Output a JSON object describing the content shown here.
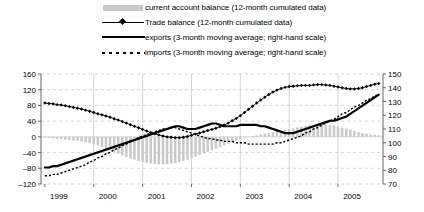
{
  "legend": {
    "items": [
      {
        "label": "current account balance (12-month cumulated data)",
        "marker": "bars-swatch-icon"
      },
      {
        "label": "Trade balance (12-month cumulated data)",
        "marker": "thin-line-diamond-icon"
      },
      {
        "label": "exports (3-month moving average; right-hand scale)",
        "marker": "thick-line-icon"
      },
      {
        "label": "imports (3-month moving average; right-hand scale)",
        "marker": "dotted-line-icon"
      }
    ]
  },
  "chart_data": {
    "type": "bar",
    "title": "",
    "xlabel": "",
    "ylabel": "",
    "grid": true,
    "legend_position": "top",
    "x_tick_labels": [
      "1999",
      "2000",
      "2001",
      "2002",
      "2003",
      "2004",
      "2005"
    ],
    "x_tick_values": [
      1999,
      2000,
      2001,
      2002,
      2003,
      2004,
      2005
    ],
    "xlim": [
      1998.92,
      2005.92
    ],
    "left_axis": {
      "ticks": [
        160,
        120,
        80,
        40,
        0,
        -40,
        -80,
        -120
      ],
      "ylim": [
        -120,
        160
      ],
      "label": ""
    },
    "right_axis": {
      "ticks": [
        150,
        140,
        130,
        120,
        110,
        100,
        90,
        80,
        70
      ],
      "ylim": [
        70,
        150
      ],
      "label": ""
    },
    "colors": {
      "bars": "#c9c9c9",
      "trade_balance": "#000000",
      "exports": "#000000",
      "imports": "#000000",
      "grid": "#bbbbbb",
      "axis": "#555555"
    },
    "series": [
      {
        "name": "current account balance (12-month cumulated data)",
        "type": "bar",
        "axis": "left",
        "x": [
          1999.0,
          1999.083,
          1999.167,
          1999.25,
          1999.333,
          1999.417,
          1999.5,
          1999.583,
          1999.667,
          1999.75,
          1999.833,
          1999.917,
          2000.0,
          2000.083,
          2000.167,
          2000.25,
          2000.333,
          2000.417,
          2000.5,
          2000.583,
          2000.667,
          2000.75,
          2000.833,
          2000.917,
          2001.0,
          2001.083,
          2001.167,
          2001.25,
          2001.333,
          2001.417,
          2001.5,
          2001.583,
          2001.667,
          2001.75,
          2001.833,
          2001.917,
          2002.0,
          2002.083,
          2002.167,
          2002.25,
          2002.333,
          2002.417,
          2002.5,
          2002.583,
          2002.667,
          2002.75,
          2002.833,
          2002.917,
          2003.0,
          2003.083,
          2003.167,
          2003.25,
          2003.333,
          2003.417,
          2003.5,
          2003.583,
          2003.667,
          2003.75,
          2003.833,
          2003.917,
          2004.0,
          2004.083,
          2004.167,
          2004.25,
          2004.333,
          2004.417,
          2004.5,
          2004.583,
          2004.667,
          2004.75,
          2004.833,
          2004.917,
          2005.0,
          2005.083,
          2005.167,
          2005.25,
          2005.333,
          2005.417,
          2005.5,
          2005.583,
          2005.667,
          2005.75,
          2005.833
        ],
        "values": [
          -2,
          -3,
          -4,
          -5,
          -6,
          -7,
          -8,
          -9,
          -10,
          -12,
          -14,
          -16,
          -19,
          -22,
          -26,
          -30,
          -34,
          -38,
          -43,
          -47,
          -51,
          -55,
          -58,
          -61,
          -64,
          -66,
          -68,
          -69,
          -70,
          -70,
          -69,
          -68,
          -66,
          -64,
          -61,
          -58,
          -54,
          -50,
          -46,
          -42,
          -38,
          -34,
          -30,
          -26,
          -22,
          -18,
          -14,
          -10,
          -6,
          -3,
          0,
          2,
          4,
          6,
          8,
          10,
          12,
          14,
          16,
          18,
          20,
          22,
          24,
          26,
          28,
          30,
          31,
          32,
          32,
          31,
          30,
          29,
          27,
          24,
          21,
          18,
          15,
          12,
          10,
          8,
          6,
          5,
          4
        ]
      },
      {
        "name": "Trade balance (12-month cumulated data)",
        "type": "line-marker",
        "axis": "left",
        "x": [
          1999.0,
          1999.083,
          1999.167,
          1999.25,
          1999.333,
          1999.417,
          1999.5,
          1999.583,
          1999.667,
          1999.75,
          1999.833,
          1999.917,
          2000.0,
          2000.083,
          2000.167,
          2000.25,
          2000.333,
          2000.417,
          2000.5,
          2000.583,
          2000.667,
          2000.75,
          2000.833,
          2000.917,
          2001.0,
          2001.083,
          2001.167,
          2001.25,
          2001.333,
          2001.417,
          2001.5,
          2001.583,
          2001.667,
          2001.75,
          2001.833,
          2001.917,
          2002.0,
          2002.083,
          2002.167,
          2002.25,
          2002.333,
          2002.417,
          2002.5,
          2002.583,
          2002.667,
          2002.75,
          2002.833,
          2002.917,
          2003.0,
          2003.083,
          2003.167,
          2003.25,
          2003.333,
          2003.417,
          2003.5,
          2003.583,
          2003.667,
          2003.75,
          2003.833,
          2003.917,
          2004.0,
          2004.083,
          2004.167,
          2004.25,
          2004.333,
          2004.417,
          2004.5,
          2004.583,
          2004.667,
          2004.75,
          2004.833,
          2004.917,
          2005.0,
          2005.083,
          2005.167,
          2005.25,
          2005.333,
          2005.417,
          2005.5,
          2005.583,
          2005.667,
          2005.75,
          2005.833
        ],
        "values": [
          86,
          85,
          84,
          82,
          81,
          79,
          77,
          75,
          73,
          71,
          68,
          65,
          62,
          59,
          56,
          53,
          50,
          46,
          43,
          39,
          35,
          31,
          27,
          23,
          19,
          15,
          11,
          8,
          5,
          2,
          0,
          -1,
          -2,
          -2,
          -1,
          1,
          4,
          7,
          10,
          13,
          16,
          19,
          22,
          26,
          30,
          35,
          41,
          47,
          54,
          62,
          70,
          78,
          86,
          94,
          101,
          108,
          114,
          119,
          123,
          126,
          128,
          129,
          130,
          131,
          131,
          131,
          132,
          133,
          133,
          132,
          131,
          129,
          127,
          125,
          123,
          122,
          122,
          123,
          125,
          128,
          131,
          134,
          136
        ]
      },
      {
        "name": "exports (3-month moving average; right-hand scale)",
        "type": "line-thick",
        "axis": "right",
        "x": [
          1999.0,
          1999.083,
          1999.167,
          1999.25,
          1999.333,
          1999.417,
          1999.5,
          1999.583,
          1999.667,
          1999.75,
          1999.833,
          1999.917,
          2000.0,
          2000.083,
          2000.167,
          2000.25,
          2000.333,
          2000.417,
          2000.5,
          2000.583,
          2000.667,
          2000.75,
          2000.833,
          2000.917,
          2001.0,
          2001.083,
          2001.167,
          2001.25,
          2001.333,
          2001.417,
          2001.5,
          2001.583,
          2001.667,
          2001.75,
          2001.833,
          2001.917,
          2002.0,
          2002.083,
          2002.167,
          2002.25,
          2002.333,
          2002.417,
          2002.5,
          2002.583,
          2002.667,
          2002.75,
          2002.833,
          2002.917,
          2003.0,
          2003.083,
          2003.167,
          2003.25,
          2003.333,
          2003.417,
          2003.5,
          2003.583,
          2003.667,
          2003.75,
          2003.833,
          2003.917,
          2004.0,
          2004.083,
          2004.167,
          2004.25,
          2004.333,
          2004.417,
          2004.5,
          2004.583,
          2004.667,
          2004.75,
          2004.833,
          2004.917,
          2005.0,
          2005.083,
          2005.167,
          2005.25,
          2005.333,
          2005.417,
          2005.5,
          2005.583,
          2005.667,
          2005.75,
          2005.833
        ],
        "values": [
          82,
          82,
          83,
          83,
          84,
          85,
          86,
          87,
          88,
          89,
          90,
          91,
          92,
          93,
          94,
          95,
          96,
          97,
          98,
          99,
          100,
          101,
          102,
          103,
          104,
          105,
          106,
          107,
          108,
          109,
          110,
          111,
          112,
          112,
          111,
          110,
          110,
          110,
          111,
          112,
          113,
          114,
          114,
          113,
          112,
          112,
          112,
          112,
          113,
          113,
          113,
          113,
          113,
          112,
          112,
          111,
          110,
          109,
          108,
          107,
          107,
          107,
          108,
          109,
          110,
          111,
          112,
          113,
          114,
          115,
          116,
          116,
          117,
          118,
          119,
          121,
          123,
          125,
          127,
          129,
          131,
          133,
          135
        ]
      },
      {
        "name": "imports (3-month moving average; right-hand scale)",
        "type": "line-dotted",
        "axis": "right",
        "x": [
          1999.0,
          1999.083,
          1999.167,
          1999.25,
          1999.333,
          1999.417,
          1999.5,
          1999.583,
          1999.667,
          1999.75,
          1999.833,
          1999.917,
          2000.0,
          2000.083,
          2000.167,
          2000.25,
          2000.333,
          2000.417,
          2000.5,
          2000.583,
          2000.667,
          2000.75,
          2000.833,
          2000.917,
          2001.0,
          2001.083,
          2001.167,
          2001.25,
          2001.333,
          2001.417,
          2001.5,
          2001.583,
          2001.667,
          2001.75,
          2001.833,
          2001.917,
          2002.0,
          2002.083,
          2002.167,
          2002.25,
          2002.333,
          2002.417,
          2002.5,
          2002.583,
          2002.667,
          2002.75,
          2002.833,
          2002.917,
          2003.0,
          2003.083,
          2003.167,
          2003.25,
          2003.333,
          2003.417,
          2003.5,
          2003.583,
          2003.667,
          2003.75,
          2003.833,
          2003.917,
          2004.0,
          2004.083,
          2004.167,
          2004.25,
          2004.333,
          2004.417,
          2004.5,
          2004.583,
          2004.667,
          2004.75,
          2004.833,
          2004.917,
          2005.0,
          2005.083,
          2005.167,
          2005.25,
          2005.333,
          2005.417,
          2005.5,
          2005.583,
          2005.667,
          2005.75,
          2005.833
        ],
        "values": [
          76,
          76,
          77,
          77,
          78,
          79,
          80,
          81,
          82,
          83,
          84,
          86,
          87,
          89,
          90,
          92,
          93,
          95,
          96,
          98,
          99,
          101,
          102,
          104,
          105,
          106,
          107,
          108,
          109,
          110,
          110,
          111,
          111,
          110,
          109,
          108,
          107,
          106,
          105,
          104,
          103,
          103,
          102,
          102,
          101,
          101,
          101,
          100,
          100,
          100,
          99,
          99,
          99,
          99,
          99,
          99,
          99,
          100,
          100,
          101,
          102,
          103,
          104,
          105,
          107,
          108,
          110,
          111,
          113,
          114,
          116,
          117,
          119,
          121,
          122,
          124,
          126,
          127,
          129,
          131,
          132,
          134,
          135
        ]
      }
    ]
  }
}
